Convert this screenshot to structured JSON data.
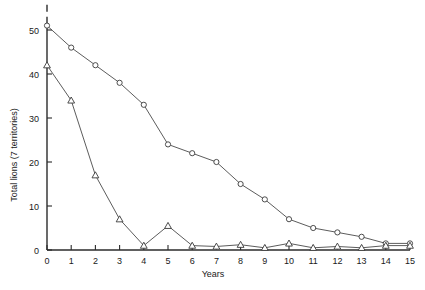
{
  "chart_data": {
    "type": "line",
    "title": "",
    "xlabel": "Years",
    "ylabel": "Total lions (7 territories)",
    "x": [
      0,
      1,
      2,
      3,
      4,
      5,
      6,
      7,
      8,
      9,
      10,
      11,
      12,
      13,
      14,
      15
    ],
    "xlim": [
      0,
      15
    ],
    "ylim": [
      0,
      53
    ],
    "xticks": [
      0,
      1,
      2,
      3,
      4,
      5,
      6,
      7,
      8,
      9,
      10,
      11,
      12,
      13,
      14,
      15
    ],
    "xtick_labels": [
      "0",
      "1",
      "2",
      "3",
      "4",
      "5",
      "6",
      "7",
      "8",
      "9",
      "10",
      "11",
      "12",
      "13",
      "14",
      "15"
    ],
    "yticks": [
      0,
      10,
      20,
      30,
      40,
      50
    ],
    "ytick_labels": [
      "0",
      "10",
      "20",
      "30",
      "40",
      "50"
    ],
    "grid": false,
    "legend": "none",
    "series": [
      {
        "name": "circle-series",
        "marker": "open-circle",
        "values": [
          51,
          46,
          42,
          38,
          33,
          24,
          22,
          20,
          15,
          11.5,
          7,
          5,
          4,
          3,
          1.5,
          1.5
        ]
      },
      {
        "name": "triangle-series",
        "marker": "open-triangle",
        "values": [
          42,
          34,
          17,
          7,
          1,
          5.5,
          1,
          0.8,
          1.2,
          0.5,
          1.5,
          0.5,
          0.8,
          0.5,
          1,
          1
        ]
      }
    ]
  },
  "axes": {
    "x_title": "Years",
    "y_title": "Total lions (7 territories)"
  },
  "colors": {
    "axis": "#2b2b2b",
    "line": "#4a4a4a",
    "marker_fill": "#ffffff",
    "marker_stroke": "#3a3a3a",
    "background": "#ffffff"
  }
}
